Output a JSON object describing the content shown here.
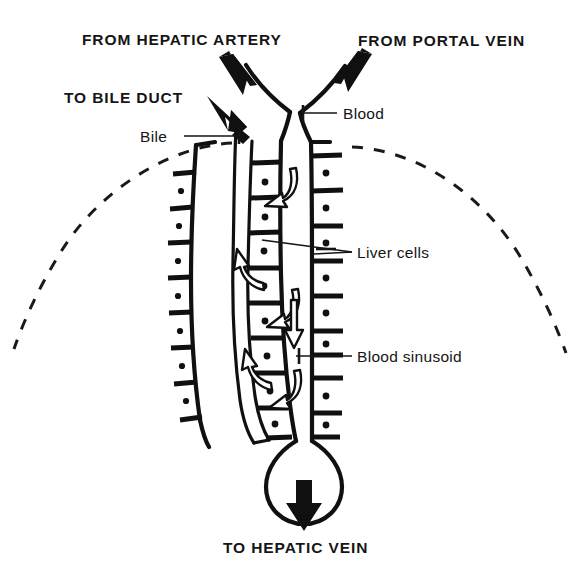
{
  "figure": {
    "background_color": "#ffffff",
    "ink_color": "#101010"
  },
  "labels": {
    "from_hepatic_artery": "FROM HEPATIC ARTERY",
    "from_portal_vein": "FROM PORTAL VEIN",
    "to_bile_duct": "TO BILE DUCT",
    "to_hepatic_vein": "TO HEPATIC VEIN",
    "bile": "Bile",
    "blood": "Blood",
    "liver_cells": "Liver cells",
    "blood_sinusoid": "Blood sinusoid"
  },
  "icons": {
    "inflow_artery_arrow": "thick-arrow-down-right-icon",
    "inflow_portal_arrow": "thick-arrow-down-left-icon",
    "bile_outflow_arrow": "thick-arrow-up-left-icon",
    "hepatic_vein_arrow": "thick-arrow-down-icon",
    "sinusoid_flow_arrow": "open-arrow-down-icon",
    "bile_flow_arrow": "curved-arrow-up-icon",
    "blood_to_cell_arrow": "curved-arrow-left-icon",
    "lobule_boundary": "dashed-arc-icon",
    "central_vein_bulb": "bulb-terminal-icon"
  },
  "structures": {
    "left_cell_column": "liver cell plate, left",
    "bile_canaliculus": "bile channel between cell plates",
    "middle_cell_column": "liver cell plate, middle",
    "blood_sinusoid_channel": "central blood sinusoid",
    "right_cell_column": "liver cell plate, right",
    "central_vein": "central vein draining to hepatic vein"
  }
}
